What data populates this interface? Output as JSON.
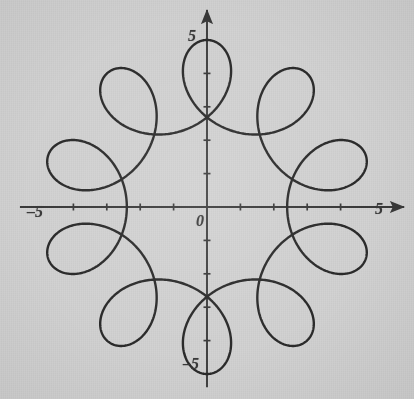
{
  "figure": {
    "width": 414,
    "height": 399,
    "background_color": "#d2d2d2",
    "ink_color": "#2b2b2b",
    "axis_color": "#3a3a3a"
  },
  "axes": {
    "origin_px": {
      "x": 207,
      "y": 207
    },
    "unit_px": 33.4,
    "x_range": [
      -5.6,
      5.9
    ],
    "y_range": [
      -5.4,
      5.9
    ],
    "tick_values": [
      -4,
      -3,
      -2,
      -1,
      1,
      2,
      3,
      4
    ],
    "tick_length_px": 7,
    "arrowheads": [
      "x-positive",
      "y-positive"
    ],
    "grid": false,
    "labels": [
      {
        "name": "origin-label",
        "text": "0",
        "x_px": 196,
        "y_px": 212
      },
      {
        "name": "x-max-label",
        "text": "5",
        "x_px": 375,
        "y_px": 200
      },
      {
        "name": "x-min-label",
        "text": "–5",
        "x_px": 27,
        "y_px": 203
      },
      {
        "name": "y-max-label",
        "text": "5",
        "x_px": 188,
        "y_px": 27
      },
      {
        "name": "y-min-label",
        "text": "–5",
        "x_px": 183,
        "y_px": 355
      }
    ]
  },
  "chart_data": {
    "type": "line",
    "title": "",
    "xlabel": "",
    "ylabel": "",
    "xlim": [
      -5.6,
      5.9
    ],
    "ylim": [
      -5.4,
      5.9
    ],
    "grid": false,
    "legend": null,
    "curve": {
      "name": "hypotrochoid-10-loop",
      "description": "Closed roulette curve with 10 inward loops, outer radius 5, inner loop radius about 2.4",
      "parametric": {
        "x": "3.7*cos(t) + 1.3*cos(9*t)",
        "y": "3.7*sin(t) - 1.3*sin(9*t)",
        "t_start": 0,
        "t_end": 6.283185307179586,
        "samples": 2000,
        "phase_deg": 90
      },
      "loop_count": 10,
      "max_radius": 5.0,
      "min_radius": 2.4,
      "line_width_px": 2.4,
      "color": "#2b2b2b"
    }
  }
}
